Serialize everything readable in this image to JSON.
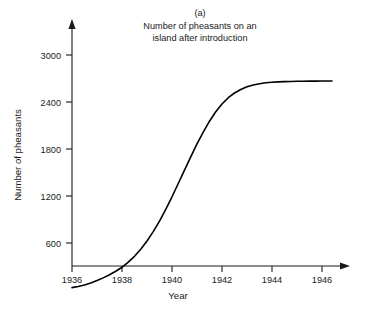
{
  "chart_data": {
    "type": "line",
    "title": "Number of pheasants on an island after introduction",
    "panel_label": "(a)",
    "title_line1": "Number of pheasants on an",
    "title_line2": "island after introduction",
    "xlabel": "Year",
    "ylabel": "Number of pheasants",
    "xlim": [
      1936,
      1947
    ],
    "ylim": [
      0,
      3200
    ],
    "xticks": [
      1936,
      1938,
      1940,
      1942,
      1944,
      1946
    ],
    "xtick_labels": [
      "1936",
      "1938",
      "1940",
      "1942",
      "1944",
      "1946"
    ],
    "yticks": [
      600,
      1200,
      1800,
      2400,
      3000
    ],
    "ytick_labels": [
      "600",
      "1200",
      "1800",
      "2400",
      "3000"
    ],
    "grid": false,
    "legend": null,
    "line_color": "#000000",
    "axis_color": "#1a1a1a",
    "series": [
      {
        "name": "Pheasant population",
        "x": [
          1936.0,
          1936.25,
          1936.5,
          1936.75,
          1937.0,
          1937.25,
          1937.5,
          1937.75,
          1938.0,
          1938.25,
          1938.5,
          1938.75,
          1939.0,
          1939.25,
          1939.5,
          1939.75,
          1940.0,
          1940.25,
          1940.5,
          1940.75,
          1941.0,
          1941.25,
          1941.5,
          1941.75,
          1942.0,
          1942.25,
          1942.5,
          1942.75,
          1943.0,
          1943.25,
          1943.5,
          1943.75,
          1944.0,
          1944.25,
          1944.5,
          1944.75,
          1945.0,
          1945.25,
          1945.5,
          1945.75,
          1946.0,
          1946.25,
          1946.4
        ],
        "y": [
          30,
          45,
          65,
          90,
          120,
          155,
          195,
          240,
          290,
          355,
          430,
          520,
          625,
          745,
          880,
          1030,
          1190,
          1360,
          1530,
          1700,
          1865,
          2015,
          2155,
          2275,
          2375,
          2455,
          2515,
          2560,
          2595,
          2618,
          2634,
          2645,
          2652,
          2657,
          2660,
          2662,
          2664,
          2665,
          2666,
          2667,
          2668,
          2668,
          2668
        ]
      }
    ],
    "annotations": []
  }
}
